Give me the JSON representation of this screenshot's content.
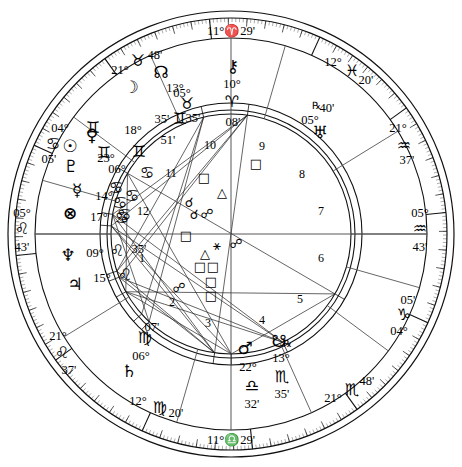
{
  "chart": {
    "type": "natal-horoscope-wheel",
    "angles": {
      "mc": {
        "deg": "11°",
        "sign_glyph": "♈",
        "sign_name": "Aries",
        "min": "29'",
        "label": "11°♈29'"
      },
      "ic": {
        "deg": "11°",
        "sign_glyph": "♎",
        "sign_name": "Libra",
        "min": "29'",
        "label": "11°♎29'"
      },
      "asc": {
        "deg": "05°",
        "sign_glyph": "♌",
        "sign_name": "Leo",
        "min": "43'",
        "label": "05°♌43'"
      },
      "dsc": {
        "deg": "05°",
        "sign_glyph": "♒",
        "sign_name": "Aquarius",
        "min": "43'",
        "label": "05°♒43'"
      }
    },
    "house_cusps": [
      {
        "house": 1,
        "deg": "05°",
        "sign_glyph": "♌",
        "min": "43'"
      },
      {
        "house": 2,
        "deg": "21°",
        "sign_glyph": "♌",
        "min": "37'"
      },
      {
        "house": 3,
        "deg": "12°",
        "sign_glyph": "♍",
        "min": "20'"
      },
      {
        "house": 4,
        "deg": "11°",
        "sign_glyph": "♎",
        "min": "29'"
      },
      {
        "house": 5,
        "deg": "21°",
        "sign_glyph": "♏",
        "min": "48'"
      },
      {
        "house": 6,
        "deg": "04°",
        "sign_glyph": "♑",
        "min": "05'"
      },
      {
        "house": 7,
        "deg": "05°",
        "sign_glyph": "♒",
        "min": "43'"
      },
      {
        "house": 8,
        "deg": "21°",
        "sign_glyph": "♒",
        "min": "37'"
      },
      {
        "house": 9,
        "deg": "12°",
        "sign_glyph": "♓",
        "min": "20'"
      },
      {
        "house": 10,
        "deg": "11°",
        "sign_glyph": "♈",
        "min": "29'"
      },
      {
        "house": 11,
        "deg": "21°",
        "sign_glyph": "♉",
        "min": "48'"
      },
      {
        "house": 12,
        "deg": "04°",
        "sign_glyph": "♋",
        "min": "05'"
      }
    ],
    "house_numbers": [
      "1",
      "2",
      "3",
      "4",
      "5",
      "6",
      "7",
      "8",
      "9",
      "10",
      "11",
      "12"
    ],
    "planets": [
      {
        "name": "Moon",
        "glyph": "☽",
        "deg": "05°",
        "sign_glyph": "♉",
        "min": "35'",
        "retro": ""
      },
      {
        "name": "Venus",
        "glyph": "♀",
        "deg": "18°",
        "sign_glyph": "♊",
        "min": "46'",
        "retro": ""
      },
      {
        "name": "Sun",
        "glyph": "☉",
        "deg": "23°",
        "sign_glyph": "♊",
        "min": "51'",
        "retro": ""
      },
      {
        "name": "Pluto",
        "glyph": "♇",
        "deg": "06°",
        "sign_glyph": "♋",
        "min": "56'",
        "retro": ""
      },
      {
        "name": "Mercury",
        "glyph": "☿",
        "deg": "14°",
        "sign_glyph": "♋",
        "min": "36'",
        "retro": ""
      },
      {
        "name": "Part of Fortune",
        "glyph": "⊗",
        "deg": "17°",
        "sign_glyph": "♋",
        "min": "41'",
        "retro": ""
      },
      {
        "name": "Neptune",
        "glyph": "♆",
        "deg": "09°",
        "sign_glyph": "♌",
        "min": "35'",
        "retro": ""
      },
      {
        "name": "Jupiter",
        "glyph": "♃",
        "deg": "15°",
        "sign_glyph": "♌",
        "min": "07'",
        "retro": ""
      },
      {
        "name": "Saturn",
        "glyph": "♄",
        "deg": "06°",
        "sign_glyph": "♍",
        "min": "07'",
        "retro": ""
      },
      {
        "name": "Mars",
        "glyph": "♂",
        "deg": "22°",
        "sign_glyph": "♎",
        "min": "32'",
        "retro": ""
      },
      {
        "name": "South Node",
        "glyph": "☋",
        "deg": "13°",
        "sign_glyph": "♏",
        "min": "35'",
        "retro": "℞"
      },
      {
        "name": "Uranus",
        "glyph": "♅",
        "deg": "05°",
        "sign_glyph": "♓",
        "min": "40'",
        "retro": "℞"
      },
      {
        "name": "Chiron",
        "glyph": "⚷",
        "deg": "10°",
        "sign_glyph": "♈",
        "min": "08'",
        "retro": ""
      },
      {
        "name": "North Node",
        "glyph": "☊",
        "deg": "13°",
        "sign_glyph": "♉",
        "min": "35'",
        "retro": ""
      }
    ],
    "zodiac_glyphs": [
      "♈",
      "♉",
      "♊",
      "♋",
      "♌",
      "♍",
      "♎",
      "♏",
      "♐",
      "♑",
      "♒",
      "♓"
    ],
    "aspect_glyphs": {
      "conjunction": "☌",
      "opposition": "☍",
      "square": "□",
      "trine": "△",
      "sextile": "⚹",
      "quincunx": "⚻"
    },
    "colors": {
      "ink": "#000000",
      "paper": "#ffffff",
      "line": "#555555"
    }
  }
}
